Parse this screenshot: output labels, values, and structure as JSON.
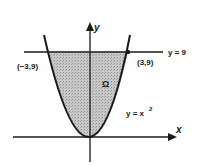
{
  "diagram": {
    "axes": {
      "x_label": "x",
      "y_label": "y"
    },
    "curves": [
      {
        "name": "parabola",
        "equation_label": "y = x",
        "exponent": "2"
      },
      {
        "name": "horizontal-line",
        "equation_label": "y = 9"
      }
    ],
    "points": [
      {
        "label": "(−3,9)"
      },
      {
        "label": "(3,9)"
      }
    ],
    "region": {
      "label": "Ω",
      "fill": "#b8b8b8"
    },
    "colors": {
      "stroke": "#1a1a1a",
      "region": "#b8b8b8"
    }
  }
}
